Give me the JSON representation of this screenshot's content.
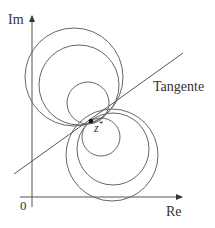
{
  "diagram": {
    "axes": {
      "x_label": "Re",
      "y_label": "Im",
      "origin_label": "0"
    },
    "tangent_label": "Tangente",
    "point_label": "z*",
    "point_label_base": "z",
    "point_label_sup": "*",
    "colors": {
      "line": "#555555",
      "text": "#333333",
      "point": "#111111"
    },
    "circles_upper": [
      {
        "cx": 74,
        "cy": 77,
        "r": 49
      },
      {
        "cx": 79,
        "cy": 85,
        "r": 40
      },
      {
        "cx": 88,
        "cy": 103,
        "r": 21
      }
    ],
    "circles_lower": [
      {
        "cx": 101,
        "cy": 137,
        "r": 19
      },
      {
        "cx": 113,
        "cy": 149,
        "r": 36
      },
      {
        "cx": 112,
        "cy": 155,
        "r": 46
      }
    ],
    "tangent_point": {
      "x": 91,
      "y": 121
    }
  }
}
